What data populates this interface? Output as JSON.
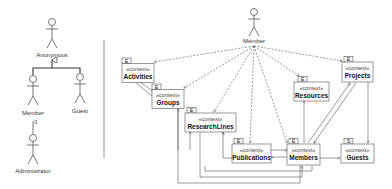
{
  "actors_hierarchy": {
    "actors": [
      {
        "id": "anonymous",
        "label": "Anonymous"
      },
      {
        "id": "member",
        "label": "Member"
      },
      {
        "id": "guest",
        "label": "Guest"
      },
      {
        "id": "administrator",
        "label": "Administrator"
      }
    ],
    "generalizations": [
      {
        "from": "member",
        "to": "anonymous"
      },
      {
        "from": "guest",
        "to": "anonymous"
      },
      {
        "from": "administrator",
        "to": "member"
      }
    ]
  },
  "context_diagram": {
    "actor": {
      "label": "Member"
    },
    "stereotype": "«context»",
    "contexts": [
      {
        "id": "activities",
        "name": "Activities",
        "tab": "E"
      },
      {
        "id": "groups",
        "name": "Groups",
        "tab": "E"
      },
      {
        "id": "researchlines",
        "name": "ResearchLines",
        "tab": "E"
      },
      {
        "id": "publications",
        "name": "Publications",
        "tab": "E"
      },
      {
        "id": "members",
        "name": "Members",
        "tab": "E"
      },
      {
        "id": "resources",
        "name": "Resources",
        "tab": "E"
      },
      {
        "id": "projects",
        "name": "Projects",
        "tab": "E"
      },
      {
        "id": "guests",
        "name": "Guests",
        "tab": "S"
      }
    ]
  }
}
